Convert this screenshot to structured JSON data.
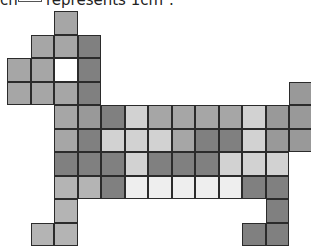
{
  "caption": {
    "prefix": "ch",
    "unit_square_label": "unit-square",
    "suffix": "represents 1cm²."
  },
  "grid": {
    "origin_x": 7,
    "origin_y": 11,
    "cell_size": 23.5,
    "palette": {
      "white": "#ffffff",
      "very_light": "#eeeeee",
      "light": "#d2d2d2",
      "light_medium": "#b4b4b4",
      "medium": "#a6a6a6",
      "medium_dark": "#999999",
      "dark": "#808080"
    },
    "cells": [
      {
        "part": "head",
        "row": 0,
        "col": 2,
        "shade": "medium"
      },
      {
        "part": "head",
        "row": 1,
        "col": 1,
        "shade": "medium"
      },
      {
        "part": "head",
        "row": 1,
        "col": 2,
        "shade": "medium"
      },
      {
        "part": "head",
        "row": 1,
        "col": 3,
        "shade": "dark"
      },
      {
        "part": "head",
        "row": 2,
        "col": 0,
        "shade": "medium"
      },
      {
        "part": "head",
        "row": 2,
        "col": 1,
        "shade": "medium"
      },
      {
        "part": "eye",
        "row": 2,
        "col": 2,
        "shade": "white"
      },
      {
        "part": "head",
        "row": 2,
        "col": 3,
        "shade": "dark"
      },
      {
        "part": "head",
        "row": 3,
        "col": 0,
        "shade": "medium"
      },
      {
        "part": "head",
        "row": 3,
        "col": 1,
        "shade": "medium"
      },
      {
        "part": "head",
        "row": 3,
        "col": 2,
        "shade": "medium"
      },
      {
        "part": "head",
        "row": 3,
        "col": 3,
        "shade": "dark"
      },
      {
        "part": "tail",
        "row": 3,
        "col": 12,
        "shade": "medium_dark"
      },
      {
        "part": "tail",
        "row": 4,
        "col": 12,
        "shade": "medium_dark"
      },
      {
        "part": "tail",
        "row": 5,
        "col": 12,
        "shade": "medium_dark"
      },
      {
        "part": "body",
        "row": 4,
        "col": 2,
        "shade": "medium"
      },
      {
        "part": "body",
        "row": 4,
        "col": 3,
        "shade": "medium_dark"
      },
      {
        "part": "body",
        "row": 4,
        "col": 4,
        "shade": "dark"
      },
      {
        "part": "body",
        "row": 4,
        "col": 5,
        "shade": "light"
      },
      {
        "part": "body",
        "row": 4,
        "col": 6,
        "shade": "medium"
      },
      {
        "part": "body",
        "row": 4,
        "col": 7,
        "shade": "medium"
      },
      {
        "part": "body",
        "row": 4,
        "col": 8,
        "shade": "medium"
      },
      {
        "part": "body",
        "row": 4,
        "col": 9,
        "shade": "medium"
      },
      {
        "part": "body",
        "row": 4,
        "col": 10,
        "shade": "light"
      },
      {
        "part": "body",
        "row": 4,
        "col": 11,
        "shade": "medium_dark"
      },
      {
        "part": "body",
        "row": 5,
        "col": 2,
        "shade": "medium"
      },
      {
        "part": "body",
        "row": 5,
        "col": 3,
        "shade": "dark"
      },
      {
        "part": "body",
        "row": 5,
        "col": 4,
        "shade": "light"
      },
      {
        "part": "body",
        "row": 5,
        "col": 5,
        "shade": "light"
      },
      {
        "part": "body",
        "row": 5,
        "col": 6,
        "shade": "light"
      },
      {
        "part": "body",
        "row": 5,
        "col": 7,
        "shade": "medium"
      },
      {
        "part": "body",
        "row": 5,
        "col": 8,
        "shade": "dark"
      },
      {
        "part": "body",
        "row": 5,
        "col": 9,
        "shade": "dark"
      },
      {
        "part": "body",
        "row": 5,
        "col": 10,
        "shade": "light"
      },
      {
        "part": "body",
        "row": 5,
        "col": 11,
        "shade": "medium_dark"
      },
      {
        "part": "body",
        "row": 6,
        "col": 2,
        "shade": "dark"
      },
      {
        "part": "body",
        "row": 6,
        "col": 3,
        "shade": "dark"
      },
      {
        "part": "body",
        "row": 6,
        "col": 4,
        "shade": "dark"
      },
      {
        "part": "body",
        "row": 6,
        "col": 5,
        "shade": "light"
      },
      {
        "part": "body",
        "row": 6,
        "col": 6,
        "shade": "dark"
      },
      {
        "part": "body",
        "row": 6,
        "col": 7,
        "shade": "dark"
      },
      {
        "part": "body",
        "row": 6,
        "col": 8,
        "shade": "dark"
      },
      {
        "part": "body",
        "row": 6,
        "col": 9,
        "shade": "light"
      },
      {
        "part": "body",
        "row": 6,
        "col": 10,
        "shade": "light"
      },
      {
        "part": "body",
        "row": 6,
        "col": 11,
        "shade": "light"
      },
      {
        "part": "body",
        "row": 7,
        "col": 2,
        "shade": "light_medium"
      },
      {
        "part": "body",
        "row": 7,
        "col": 3,
        "shade": "light_medium"
      },
      {
        "part": "body",
        "row": 7,
        "col": 4,
        "shade": "dark"
      },
      {
        "part": "body",
        "row": 7,
        "col": 5,
        "shade": "very_light"
      },
      {
        "part": "body",
        "row": 7,
        "col": 6,
        "shade": "very_light"
      },
      {
        "part": "body",
        "row": 7,
        "col": 7,
        "shade": "very_light"
      },
      {
        "part": "body",
        "row": 7,
        "col": 8,
        "shade": "very_light"
      },
      {
        "part": "body",
        "row": 7,
        "col": 9,
        "shade": "very_light"
      },
      {
        "part": "body",
        "row": 7,
        "col": 10,
        "shade": "dark"
      },
      {
        "part": "body",
        "row": 7,
        "col": 11,
        "shade": "dark"
      },
      {
        "part": "front-leg",
        "row": 8,
        "col": 2,
        "shade": "light_medium"
      },
      {
        "part": "front-leg",
        "row": 9,
        "col": 1,
        "shade": "light_medium"
      },
      {
        "part": "front-leg",
        "row": 9,
        "col": 2,
        "shade": "light_medium"
      },
      {
        "part": "back-leg",
        "row": 8,
        "col": 11,
        "shade": "dark"
      },
      {
        "part": "back-leg",
        "row": 9,
        "col": 10,
        "shade": "dark"
      },
      {
        "part": "back-leg",
        "row": 9,
        "col": 11,
        "shade": "dark"
      }
    ]
  }
}
